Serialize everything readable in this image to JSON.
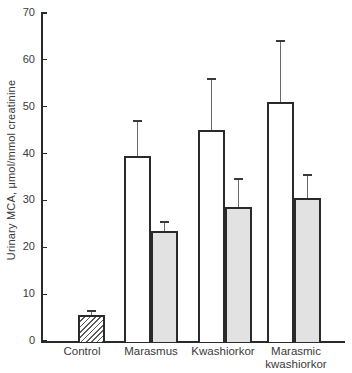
{
  "chart_data": {
    "type": "bar",
    "title": "",
    "xlabel": "",
    "ylabel": "Urinary MCA, μmol/mmol creatinine",
    "ylim": [
      0,
      70
    ],
    "yticks": [
      0,
      10,
      20,
      30,
      40,
      50,
      60,
      70
    ],
    "grid": false,
    "legend": "none",
    "error_bars": "upper only, with caps",
    "categories": [
      "Control",
      "Marasmus",
      "Kwashiorkor",
      "Marasmic kwashiorkor"
    ],
    "groups": [
      {
        "label": "Control",
        "label_lines": [
          "Control"
        ],
        "bars": [
          {
            "style": "hatched",
            "value": 5.5,
            "error": 1.0
          }
        ]
      },
      {
        "label": "Marasmus",
        "label_lines": [
          "Marasmus"
        ],
        "bars": [
          {
            "style": "open",
            "value": 39.5,
            "error": 7.5
          },
          {
            "style": "shaded",
            "value": 23.5,
            "error": 2.0
          }
        ]
      },
      {
        "label": "Kwashiorkor",
        "label_lines": [
          "Kwashiorkor"
        ],
        "bars": [
          {
            "style": "open",
            "value": 45.0,
            "error": 11.0
          },
          {
            "style": "shaded",
            "value": 28.5,
            "error": 6.0
          }
        ]
      },
      {
        "label": "Marasmic kwashiorkor",
        "label_lines": [
          "Marasmic",
          "kwashiorkor"
        ],
        "bars": [
          {
            "style": "open",
            "value": 51.0,
            "error": 13.0
          },
          {
            "style": "shaded",
            "value": 30.5,
            "error": 5.0
          }
        ]
      }
    ],
    "bar_styles": {
      "open": "white fill, black outline",
      "shaded": "light gray fill, black outline",
      "hatched": "white fill with diagonal /// hatching, black outline"
    }
  },
  "colors": {
    "background": "#ffffff",
    "axis": "#2a2a2a",
    "bar_border": "#2a2a2a",
    "shaded_fill": "#e2e2e2",
    "text": "#3a3a3a",
    "error_bar": "#6a6a6a"
  }
}
